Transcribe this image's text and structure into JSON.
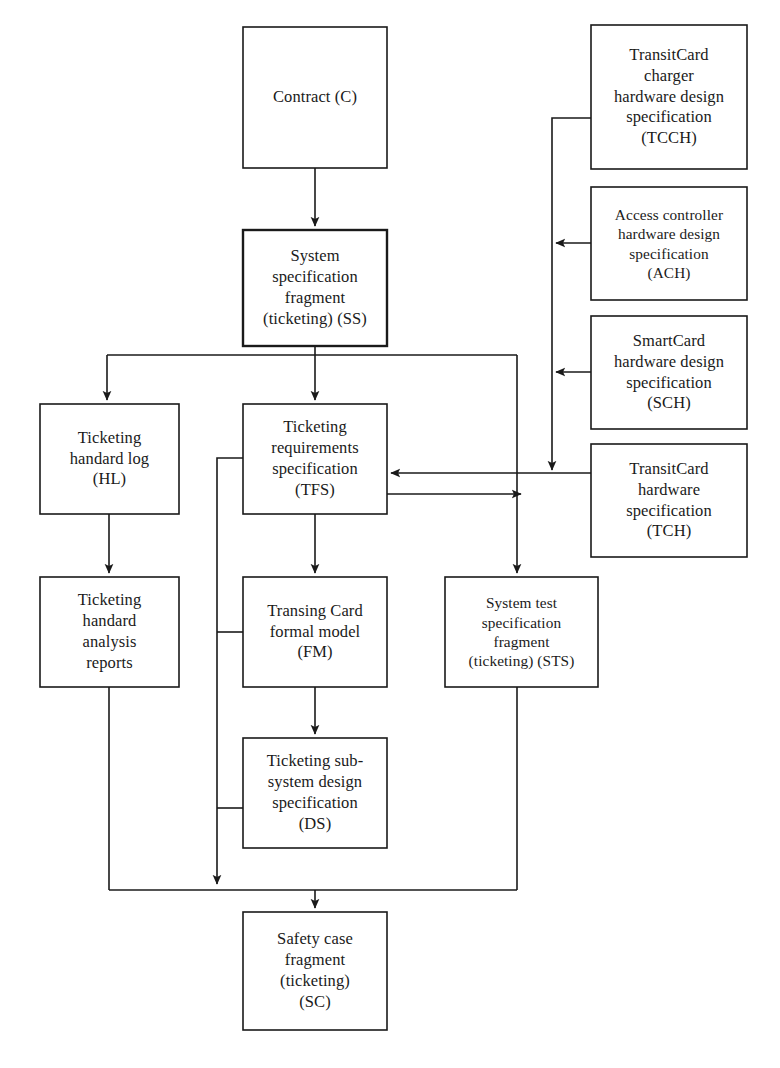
{
  "diagram": {
    "type": "flowchart",
    "title": "",
    "background_color": "#ffffff",
    "line_color": "#1a1a1a",
    "nodes": [
      {
        "id": "C",
        "name": "contract",
        "lines": [
          "Contract (C)"
        ],
        "x": 243,
        "y": 27,
        "w": 144,
        "h": 141,
        "emphasis": false
      },
      {
        "id": "SS",
        "name": "system-specification-fragment",
        "lines": [
          "System",
          "specification",
          "fragment",
          "(ticketing) (SS)"
        ],
        "x": 243,
        "y": 230,
        "w": 144,
        "h": 116,
        "emphasis": true
      },
      {
        "id": "TCCH",
        "name": "transitcard-charger-hardware-design-specification",
        "lines": [
          "TransitCard",
          "charger",
          "hardware design",
          "specification",
          "(TCCH)"
        ],
        "x": 591,
        "y": 25,
        "w": 156,
        "h": 144,
        "emphasis": false
      },
      {
        "id": "ACH",
        "name": "access-controller-hardware-design-specification",
        "lines": [
          "Access controller",
          "hardware design",
          "specification",
          "(ACH)"
        ],
        "x": 591,
        "y": 187,
        "w": 156,
        "h": 113,
        "emphasis": false
      },
      {
        "id": "SCH",
        "name": "smartcard-hardware-design-specification",
        "lines": [
          "SmartCard",
          "hardware design",
          "specification",
          "(SCH)"
        ],
        "x": 591,
        "y": 316,
        "w": 156,
        "h": 113,
        "emphasis": false
      },
      {
        "id": "TCH",
        "name": "transitcard-hardware-specification",
        "lines": [
          "TransitCard",
          "hardware",
          "specification",
          "(TCH)"
        ],
        "x": 591,
        "y": 444,
        "w": 156,
        "h": 113,
        "emphasis": false
      },
      {
        "id": "HL",
        "name": "ticketing-handard-log",
        "lines": [
          "Ticketing",
          "handard log",
          "(HL)"
        ],
        "x": 40,
        "y": 404,
        "w": 139,
        "h": 110,
        "emphasis": false
      },
      {
        "id": "HAR",
        "name": "ticketing-handard-analysis-reports",
        "lines": [
          "Ticketing",
          "handard",
          "analysis",
          "reports"
        ],
        "x": 40,
        "y": 577,
        "w": 139,
        "h": 110,
        "emphasis": false
      },
      {
        "id": "TFS",
        "name": "ticketing-requirements-specification",
        "lines": [
          "Ticketing",
          "requirements",
          "specification",
          "(TFS)"
        ],
        "x": 243,
        "y": 404,
        "w": 144,
        "h": 110,
        "emphasis": false
      },
      {
        "id": "FM",
        "name": "transing-card-formal-model",
        "lines": [
          "Transing Card",
          "formal model",
          "(FM)"
        ],
        "x": 243,
        "y": 577,
        "w": 144,
        "h": 110,
        "emphasis": false
      },
      {
        "id": "STS",
        "name": "system-test-specification-fragment",
        "lines": [
          "System test",
          "specification",
          "fragment",
          "(ticketing) (STS)"
        ],
        "x": 445,
        "y": 577,
        "w": 153,
        "h": 110,
        "emphasis": false
      },
      {
        "id": "DS",
        "name": "ticketing-sub-system-design-specification",
        "lines": [
          "Ticketing sub-",
          "system design",
          "specification",
          "(DS)"
        ],
        "x": 243,
        "y": 738,
        "w": 144,
        "h": 110,
        "emphasis": false
      },
      {
        "id": "SC",
        "name": "safety-case-fragment",
        "lines": [
          "Safety case",
          "fragment",
          "(ticketing)",
          "(SC)"
        ],
        "x": 243,
        "y": 912,
        "w": 144,
        "h": 118,
        "emphasis": false
      }
    ],
    "edges": [
      {
        "name": "edge-contract-to-system-spec",
        "from": "C",
        "to": "SS",
        "arrow": true
      },
      {
        "name": "edge-system-spec-to-handard-log",
        "from": "SS",
        "to": "HL",
        "arrow": true
      },
      {
        "name": "edge-system-spec-to-requirements",
        "from": "SS",
        "to": "TFS",
        "arrow": true
      },
      {
        "name": "edge-system-spec-to-system-test",
        "from": "SS",
        "to": "STS",
        "arrow": true
      },
      {
        "name": "edge-handard-log-to-analysis-reports",
        "from": "HL",
        "to": "HAR",
        "arrow": true
      },
      {
        "name": "edge-requirements-to-formal-model",
        "from": "TFS",
        "to": "FM",
        "arrow": true
      },
      {
        "name": "edge-formal-model-to-design-spec",
        "from": "FM",
        "to": "DS",
        "arrow": true
      },
      {
        "name": "edge-transitcard-hardware-to-requirements",
        "from": "TCH",
        "to": "TFS",
        "arrow": true
      },
      {
        "name": "edge-requirements-to-system-test-line",
        "from": "TFS",
        "to": "STS",
        "arrow": true
      },
      {
        "name": "edge-charger-spec-to-transitcard-hardware",
        "from": "TCCH",
        "to": "TCH",
        "arrow": true
      },
      {
        "name": "edge-access-controller-to-trunk",
        "from": "ACH",
        "to": "trunk",
        "arrow": true
      },
      {
        "name": "edge-smartcard-to-trunk",
        "from": "SCH",
        "to": "trunk",
        "arrow": true
      },
      {
        "name": "edge-requirements-trunk-to-safety-case",
        "from": "TFS",
        "to": "SC",
        "arrow": true
      },
      {
        "name": "edge-analysis-reports-to-safety-bus",
        "from": "HAR",
        "to": "SC",
        "arrow": false
      },
      {
        "name": "edge-system-test-to-safety-bus",
        "from": "STS",
        "to": "SC",
        "arrow": false
      },
      {
        "name": "edge-safety-bus-to-safety-case",
        "from": "bus",
        "to": "SC",
        "arrow": true
      }
    ]
  }
}
